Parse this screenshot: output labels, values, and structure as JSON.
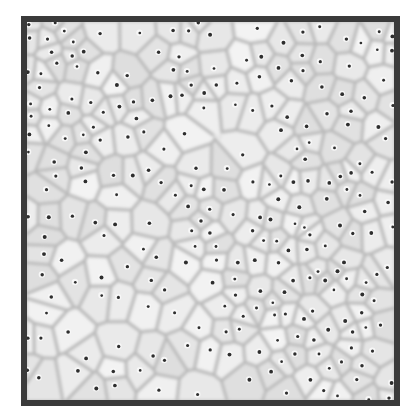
{
  "image": {
    "description": "Grayscale micrograph of a cellular/foam-like Voronoi pattern with small dark nuclei dots, framed by a dark border",
    "colors": {
      "frame": "#3a3a3a",
      "cell_fill": "#e6e6e6",
      "cell_edge": "#9a9a9a",
      "nucleus": "#2e2e2e",
      "halo": "#f7f7f7"
    },
    "seed_count": 260,
    "random_seed": 7
  }
}
